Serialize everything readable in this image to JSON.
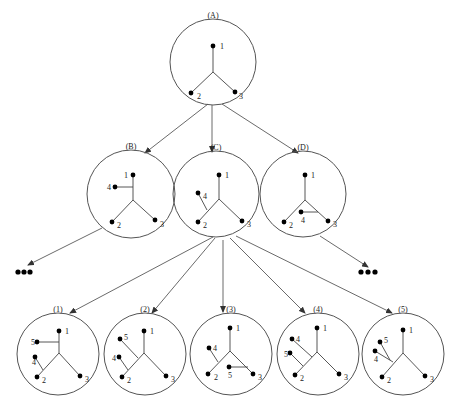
{
  "diagram": {
    "title": "",
    "colors": {
      "line": "#444444",
      "circle": "#555555",
      "node": "#000000",
      "background": "#ffffff"
    },
    "trees": [
      {
        "id": "A",
        "label": "(A)",
        "cx": 213,
        "cy": 62,
        "r": 43,
        "center": [
          213,
          72
        ],
        "nodes": [
          {
            "id": "1",
            "x": 213,
            "y": 46,
            "lx": 220,
            "ly": 49
          },
          {
            "id": "2",
            "x": 191,
            "y": 93,
            "lx": 197,
            "ly": 99
          },
          {
            "id": "3",
            "x": 235,
            "y": 92,
            "lx": 239,
            "ly": 99
          }
        ],
        "edges": [
          [
            213,
            46,
            213,
            72
          ],
          [
            213,
            72,
            191,
            93
          ],
          [
            213,
            72,
            235,
            92
          ]
        ]
      },
      {
        "id": "B",
        "label": "(B)",
        "cx": 131,
        "cy": 194,
        "r": 44,
        "center": [
          134,
          200
        ],
        "nodes": [
          {
            "id": "1",
            "x": 133,
            "y": 175,
            "lx": 124,
            "ly": 178
          },
          {
            "id": "4",
            "x": 115,
            "y": 187,
            "lx": 107,
            "ly": 190
          },
          {
            "id": "2",
            "x": 112,
            "y": 222,
            "lx": 117,
            "ly": 228
          },
          {
            "id": "3",
            "x": 155,
            "y": 220,
            "lx": 160,
            "ly": 227
          }
        ],
        "edges": [
          [
            133,
            175,
            133,
            200
          ],
          [
            133,
            200,
            112,
            222
          ],
          [
            133,
            200,
            155,
            220
          ],
          [
            115,
            187,
            133,
            187
          ]
        ]
      },
      {
        "id": "C",
        "label": "(C)",
        "cx": 216,
        "cy": 194,
        "r": 43,
        "center": [
          219,
          199
        ],
        "nodes": [
          {
            "id": "1",
            "x": 219,
            "y": 175,
            "lx": 225,
            "ly": 178
          },
          {
            "id": "4",
            "x": 198,
            "y": 193,
            "lx": 203,
            "ly": 199
          },
          {
            "id": "2",
            "x": 198,
            "y": 222,
            "lx": 203,
            "ly": 228
          },
          {
            "id": "3",
            "x": 242,
            "y": 221,
            "lx": 247,
            "ly": 227
          }
        ],
        "edges": [
          [
            219,
            175,
            219,
            199
          ],
          [
            219,
            199,
            198,
            222
          ],
          [
            219,
            199,
            242,
            221
          ],
          [
            198,
            193,
            207,
            210
          ]
        ]
      },
      {
        "id": "D",
        "label": "(D)",
        "cx": 303,
        "cy": 194,
        "r": 43,
        "center": [
          305,
          200
        ],
        "nodes": [
          {
            "id": "1",
            "x": 305,
            "y": 175,
            "lx": 311,
            "ly": 178
          },
          {
            "id": "4",
            "x": 301,
            "y": 212,
            "lx": 301,
            "ly": 223
          },
          {
            "id": "2",
            "x": 284,
            "y": 222,
            "lx": 289,
            "ly": 228
          },
          {
            "id": "3",
            "x": 328,
            "y": 221,
            "lx": 333,
            "ly": 227
          }
        ],
        "edges": [
          [
            305,
            175,
            305,
            200
          ],
          [
            305,
            200,
            284,
            222
          ],
          [
            305,
            200,
            328,
            221
          ],
          [
            301,
            212,
            318,
            212
          ]
        ]
      },
      {
        "id": "1",
        "label": "(1)",
        "cx": 58,
        "cy": 354,
        "r": 41,
        "center": [
          59,
          353
        ],
        "nodes": [
          {
            "id": "1",
            "x": 59,
            "y": 331,
            "lx": 65,
            "ly": 334
          },
          {
            "id": "5",
            "x": 37,
            "y": 342,
            "lx": 31,
            "ly": 345
          },
          {
            "id": "4",
            "x": 35,
            "y": 357,
            "lx": 32,
            "ly": 365
          },
          {
            "id": "2",
            "x": 37,
            "y": 377,
            "lx": 42,
            "ly": 383
          },
          {
            "id": "3",
            "x": 80,
            "y": 376,
            "lx": 85,
            "ly": 382
          }
        ],
        "edges": [
          [
            59,
            331,
            59,
            353
          ],
          [
            59,
            353,
            37,
            377
          ],
          [
            59,
            353,
            80,
            376
          ],
          [
            37,
            342,
            59,
            342
          ],
          [
            35,
            357,
            43,
            370
          ]
        ]
      },
      {
        "id": "2",
        "label": "(2)",
        "cx": 145,
        "cy": 354,
        "r": 41,
        "center": [
          144,
          353
        ],
        "nodes": [
          {
            "id": "1",
            "x": 144,
            "y": 331,
            "lx": 150,
            "ly": 334
          },
          {
            "id": "5",
            "x": 120,
            "y": 339,
            "lx": 124,
            "ly": 340
          },
          {
            "id": "4",
            "x": 119,
            "y": 357,
            "lx": 112,
            "ly": 361
          },
          {
            "id": "2",
            "x": 122,
            "y": 377,
            "lx": 127,
            "ly": 383
          },
          {
            "id": "3",
            "x": 166,
            "y": 376,
            "lx": 171,
            "ly": 382
          }
        ],
        "edges": [
          [
            144,
            331,
            144,
            353
          ],
          [
            144,
            353,
            122,
            377
          ],
          [
            144,
            353,
            166,
            376
          ],
          [
            120,
            339,
            138,
            358
          ],
          [
            119,
            357,
            128,
            370
          ]
        ]
      },
      {
        "id": "3",
        "label": "(3)",
        "cx": 231,
        "cy": 354,
        "r": 41,
        "center": [
          230,
          351
        ],
        "nodes": [
          {
            "id": "1",
            "x": 230,
            "y": 328,
            "lx": 236,
            "ly": 331
          },
          {
            "id": "4",
            "x": 209,
            "y": 348,
            "lx": 213,
            "ly": 351
          },
          {
            "id": "2",
            "x": 208,
            "y": 374,
            "lx": 214,
            "ly": 380
          },
          {
            "id": "5",
            "x": 229,
            "y": 367,
            "lx": 228,
            "ly": 378
          },
          {
            "id": "3",
            "x": 253,
            "y": 374,
            "lx": 258,
            "ly": 380
          }
        ],
        "edges": [
          [
            230,
            328,
            230,
            351
          ],
          [
            230,
            351,
            208,
            374
          ],
          [
            230,
            351,
            253,
            374
          ],
          [
            209,
            348,
            218,
            362
          ],
          [
            229,
            367,
            248,
            367
          ]
        ]
      },
      {
        "id": "4",
        "label": "(4)",
        "cx": 318,
        "cy": 354,
        "r": 41,
        "center": [
          317,
          352
        ],
        "nodes": [
          {
            "id": "1",
            "x": 317,
            "y": 328,
            "lx": 323,
            "ly": 331
          },
          {
            "id": "4",
            "x": 292,
            "y": 339,
            "lx": 296,
            "ly": 342
          },
          {
            "id": "5",
            "x": 290,
            "y": 353,
            "lx": 284,
            "ly": 357
          },
          {
            "id": "2",
            "x": 295,
            "y": 375,
            "lx": 300,
            "ly": 381
          },
          {
            "id": "3",
            "x": 339,
            "y": 374,
            "lx": 344,
            "ly": 380
          }
        ],
        "edges": [
          [
            317,
            328,
            317,
            352
          ],
          [
            317,
            352,
            295,
            375
          ],
          [
            317,
            352,
            339,
            374
          ],
          [
            292,
            339,
            312,
            357
          ],
          [
            290,
            353,
            303,
            366
          ]
        ]
      },
      {
        "id": "5",
        "label": "(5)",
        "cx": 403,
        "cy": 354,
        "r": 41,
        "center": [
          403,
          353
        ],
        "nodes": [
          {
            "id": "1",
            "x": 403,
            "y": 330,
            "lx": 409,
            "ly": 333
          },
          {
            "id": "5",
            "x": 380,
            "y": 342,
            "lx": 384,
            "ly": 343
          },
          {
            "id": "4",
            "x": 375,
            "y": 351,
            "lx": 374,
            "ly": 362
          },
          {
            "id": "2",
            "x": 382,
            "y": 377,
            "lx": 387,
            "ly": 383
          },
          {
            "id": "3",
            "x": 425,
            "y": 376,
            "lx": 430,
            "ly": 382
          }
        ],
        "edges": [
          [
            403,
            330,
            403,
            353
          ],
          [
            403,
            353,
            382,
            377
          ],
          [
            403,
            353,
            425,
            376
          ],
          [
            380,
            342,
            390,
            360
          ],
          [
            375,
            351,
            393,
            362
          ]
        ]
      }
    ],
    "arrows": [
      {
        "from": "A",
        "to": "B",
        "x1": 208,
        "y1": 104,
        "x2": 145,
        "y2": 153
      },
      {
        "from": "A",
        "to": "C",
        "x1": 212,
        "y1": 105,
        "x2": 212,
        "y2": 152
      },
      {
        "from": "A",
        "to": "D",
        "x1": 222,
        "y1": 104,
        "x2": 298,
        "y2": 153
      },
      {
        "from": "B",
        "to": "ellipsis-left",
        "x1": 102,
        "y1": 228,
        "x2": 28,
        "y2": 265
      },
      {
        "from": "D",
        "to": "ellipsis-right",
        "x1": 320,
        "y1": 236,
        "x2": 368,
        "y2": 267
      },
      {
        "from": "C",
        "to": "1",
        "x1": 213,
        "y1": 237,
        "x2": 70,
        "y2": 313
      },
      {
        "from": "C",
        "to": "2",
        "x1": 215,
        "y1": 238,
        "x2": 152,
        "y2": 313
      },
      {
        "from": "C",
        "to": "3",
        "x1": 223,
        "y1": 240,
        "x2": 223,
        "y2": 312
      },
      {
        "from": "C",
        "to": "4",
        "x1": 230,
        "y1": 238,
        "x2": 305,
        "y2": 313
      },
      {
        "from": "C",
        "to": "5",
        "x1": 236,
        "y1": 236,
        "x2": 392,
        "y2": 313
      }
    ],
    "ellipses": [
      {
        "id": "ellipsis-left",
        "text": "•••",
        "dots": [
          [
            18,
            272
          ],
          [
            24,
            272
          ],
          [
            30,
            272
          ]
        ]
      },
      {
        "id": "ellipsis-right",
        "text": "•••",
        "dots": [
          [
            361,
            272
          ],
          [
            368,
            272
          ],
          [
            375,
            272
          ]
        ]
      }
    ]
  }
}
